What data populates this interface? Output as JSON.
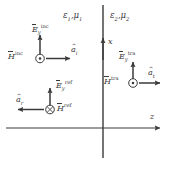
{
  "figure": {
    "background": "#ffffff",
    "stroke_color": "#3a3a3a",
    "width": 177,
    "height": 170
  },
  "axes": {
    "vertical": {
      "label": "x",
      "name": "x-axis"
    },
    "horizontal": {
      "label": "z",
      "name": "z-axis"
    }
  },
  "media": {
    "left": {
      "epsilon": "ε",
      "eps_sub": "1",
      "mu": "μ",
      "mu_sub": "1",
      "separator": ","
    },
    "right": {
      "epsilon": "ε",
      "eps_sub": "2",
      "mu": "μ",
      "mu_sub": "2",
      "separator": ","
    }
  },
  "waves": {
    "incident": {
      "e_symbol": "E",
      "e_sub": "y",
      "e_sup": "inc",
      "h_symbol": "H",
      "h_sub": "",
      "h_sup": "inc",
      "h_marker": "dot-out-of-page",
      "unit_vector": "a",
      "unit_sub": "i",
      "propagation": "right"
    },
    "reflected": {
      "e_symbol": "E",
      "e_sub": "y",
      "e_sup": "ref",
      "h_symbol": "H",
      "h_sub": "",
      "h_sup": "ref",
      "h_marker": "cross-into-page",
      "unit_vector": "a",
      "unit_sub": "r",
      "propagation": "left"
    },
    "transmitted": {
      "e_symbol": "E",
      "e_sub": "y",
      "e_sup": "tra",
      "h_symbol": "H",
      "h_sub": "",
      "h_sup": "tra",
      "h_marker": "dot-out-of-page",
      "unit_vector": "a",
      "unit_sub": "t",
      "propagation": "right"
    }
  }
}
